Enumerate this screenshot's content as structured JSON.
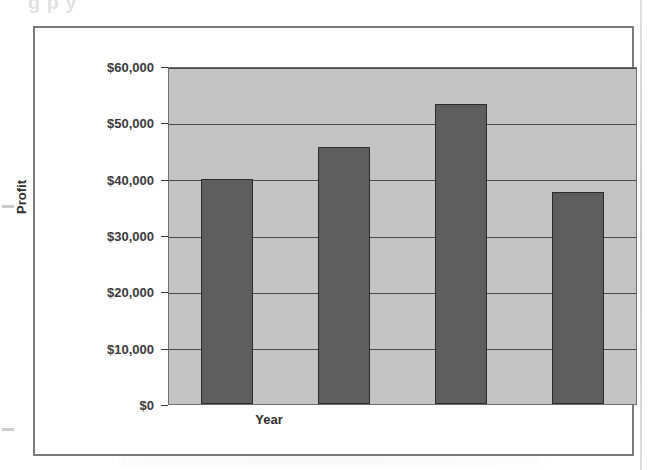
{
  "page": {
    "cut_off_heading": "g  p             y",
    "background_color": "#ffffff"
  },
  "chart_frame": {
    "border_color": "#7a7a7a"
  },
  "chart_data": {
    "type": "bar",
    "title": "",
    "categories": [
      "2006",
      "2007",
      "2008",
      "2009"
    ],
    "values": [
      40000,
      45600,
      53200,
      37600
    ],
    "series": [
      {
        "name": "Profit",
        "values": [
          40000,
          45600,
          53200,
          37600
        ]
      }
    ],
    "xlabel": "Year",
    "ylabel": "Profit",
    "ylim": [
      0,
      60000
    ],
    "ytick_values": [
      0,
      10000,
      20000,
      30000,
      40000,
      50000,
      60000
    ],
    "ytick_labels": [
      "$0",
      "$10,000",
      "$20,000",
      "$30,000",
      "$40,000",
      "$50,000",
      "$60,000"
    ],
    "grid": true,
    "legend": "none",
    "plot_background_color": "#c4c4c4",
    "bar_fill_color": "#5e5e5e",
    "bar_border_color": "#2b2b2b",
    "gridline_color": "#4a4a4a"
  }
}
